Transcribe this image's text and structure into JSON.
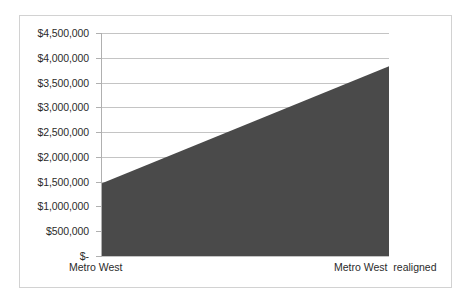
{
  "chart_data": {
    "type": "area",
    "title": "",
    "subtitle": "",
    "xlabel": "",
    "ylabel": "",
    "categories": [
      "Metro West",
      "Metro West  realigned"
    ],
    "values": [
      1470000,
      3830000
    ],
    "series": [
      {
        "name": "",
        "values": [
          1470000,
          3830000
        ]
      }
    ],
    "ylim": [
      0,
      4500000
    ],
    "ytick_values": [
      0,
      500000,
      1000000,
      1500000,
      2000000,
      2500000,
      3000000,
      3500000,
      4000000,
      4500000
    ],
    "ytick_labels": [
      "$-",
      "$500,000",
      "$1,000,000",
      "$1,500,000",
      "$2,000,000",
      "$2,500,000",
      "$3,000,000",
      "$3,500,000",
      "$4,000,000",
      "$4,500,000"
    ],
    "grid": true,
    "legend": false,
    "legend_position": "none",
    "colors": {
      "area_fill": "#4a4a4a",
      "gridline": "#c4c4c4",
      "axis": "#b0b0b0",
      "frame_border": "#d2d2d2",
      "text": "#2b2b2b",
      "background": "#ffffff"
    }
  },
  "axis": {
    "y_labels": {
      "l9": "$4,500,000",
      "l8": "$4,000,000",
      "l7": "$3,500,000",
      "l6": "$3,000,000",
      "l5": "$2,500,000",
      "l4": "$2,000,000",
      "l3": "$1,500,000",
      "l2": "$1,000,000",
      "l1": "$500,000",
      "l0": "$-"
    },
    "x_labels": {
      "left": "Metro West",
      "right": "Metro West  realigned"
    }
  }
}
